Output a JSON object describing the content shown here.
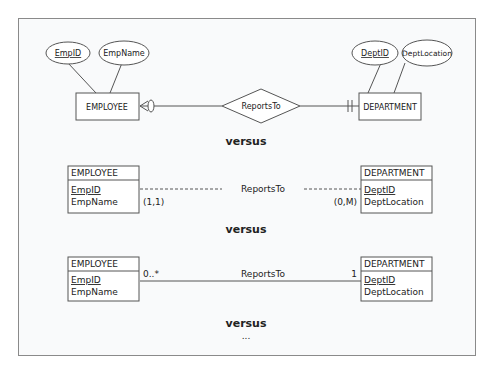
{
  "diagram1": {
    "employee_entity": "EMPLOYEE",
    "department_entity": "DEPARTMENT",
    "relationship": "ReportsTo",
    "employee_attrs": [
      {
        "label": "EmpID",
        "key": true
      },
      {
        "label": "EmpName",
        "key": false
      }
    ],
    "department_attrs": [
      {
        "label": "DeptID",
        "key": true
      },
      {
        "label": "DeptLocation",
        "key": false
      }
    ]
  },
  "versus_label": "versus",
  "diagram2": {
    "employee_title": "EMPLOYEE",
    "employee_attrs": [
      "EmpID",
      "EmpName"
    ],
    "department_title": "DEPARTMENT",
    "department_attrs": [
      "DeptID",
      "DeptLocation"
    ],
    "relationship": "ReportsTo",
    "employee_cardinality": "(1,1)",
    "department_cardinality": "(0,M)"
  },
  "diagram3": {
    "employee_title": "EMPLOYEE",
    "employee_attrs": [
      "EmpID",
      "EmpName"
    ],
    "department_title": "DEPARTMENT",
    "department_attrs": [
      "DeptID",
      "DeptLocation"
    ],
    "relationship": "ReportsTo",
    "employee_multiplicity": "0..*",
    "department_multiplicity": "1"
  },
  "ellipsis": "..."
}
